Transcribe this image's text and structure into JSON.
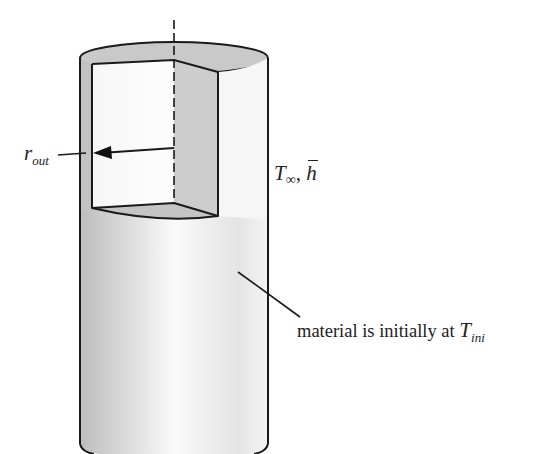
{
  "figure": {
    "type": "cylinder-cutaway-diagram",
    "colors": {
      "outline": "#1a1a1a",
      "shaded_surface": "#c8c8c8",
      "cut_face_light": "#f4f4f4",
      "cut_face_dark": "#cfcfcf",
      "background": "#ffffff"
    }
  },
  "labels": {
    "radius": {
      "main": "r",
      "sub": "out"
    },
    "ambient": {
      "T": "T",
      "T_sub": "∞",
      "sep": ", ",
      "h": "h"
    },
    "material": {
      "text": "material is initially at ",
      "T": "T",
      "T_sub": "ini"
    }
  }
}
